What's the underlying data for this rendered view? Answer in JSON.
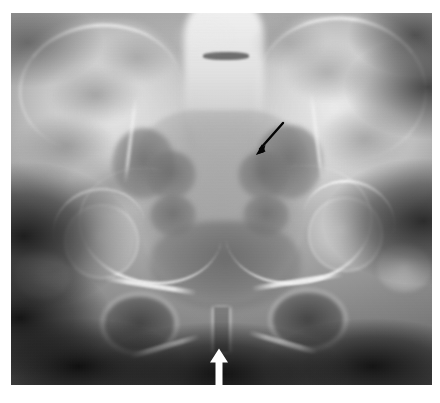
{
  "figure": {
    "type": "radiograph",
    "modality": "X-ray",
    "view": "anteroposterior-pelvis",
    "caption": "",
    "background_color": "#ffffff",
    "plate": {
      "x": 11,
      "y": 13,
      "width": 421,
      "height": 372,
      "base_color": "#8a8a8a",
      "dark_color": "#141414",
      "bright_color": "#f2f2f2"
    }
  },
  "anatomy": {
    "structures": [
      {
        "name": "iliac-wing-left",
        "label": "Left iliac wing"
      },
      {
        "name": "iliac-wing-right",
        "label": "Right iliac wing"
      },
      {
        "name": "iliac-crest-left",
        "label": "Left iliac crest"
      },
      {
        "name": "iliac-crest-right",
        "label": "Right iliac crest"
      },
      {
        "name": "lumbosacral-spine",
        "label": "Lumbosacral spine"
      },
      {
        "name": "sacrum",
        "label": "Sacrum"
      },
      {
        "name": "sacral-foramina",
        "label": "Sacral foramina"
      },
      {
        "name": "sacroiliac-joint-left",
        "label": "Left sacroiliac joint"
      },
      {
        "name": "sacroiliac-joint-right",
        "label": "Right sacroiliac joint"
      },
      {
        "name": "acetabulum-left",
        "label": "Left acetabulum"
      },
      {
        "name": "acetabulum-right",
        "label": "Right acetabulum"
      },
      {
        "name": "femoral-head-left",
        "label": "Left femoral head"
      },
      {
        "name": "femoral-head-right",
        "label": "Right femoral head"
      },
      {
        "name": "greater-trochanter-left",
        "label": "Left greater trochanter"
      },
      {
        "name": "greater-trochanter-right",
        "label": "Right greater trochanter"
      },
      {
        "name": "obturator-foramen-left",
        "label": "Left obturator foramen"
      },
      {
        "name": "obturator-foramen-right",
        "label": "Right obturator foramen"
      },
      {
        "name": "superior-pubic-ramus-left",
        "label": "Left superior pubic ramus"
      },
      {
        "name": "superior-pubic-ramus-right",
        "label": "Right superior pubic ramus"
      },
      {
        "name": "inferior-pubic-ramus-left",
        "label": "Left inferior pubic ramus"
      },
      {
        "name": "inferior-pubic-ramus-right",
        "label": "Right inferior pubic ramus"
      },
      {
        "name": "pubic-symphysis",
        "label": "Pubic symphysis"
      }
    ]
  },
  "annotations": [
    {
      "id": "black-arrow",
      "color": "#000000",
      "direction": "down-left",
      "tail": {
        "x": 283,
        "y": 124
      },
      "tip": {
        "x": 257,
        "y": 154
      },
      "points_to": "sacral-ala-right",
      "label": ""
    },
    {
      "id": "white-arrow",
      "color": "#ffffff",
      "direction": "up",
      "tail": {
        "x": 219,
        "y": 389
      },
      "tip": {
        "x": 219,
        "y": 349
      },
      "points_to": "pubic-symphysis",
      "label": ""
    }
  ]
}
